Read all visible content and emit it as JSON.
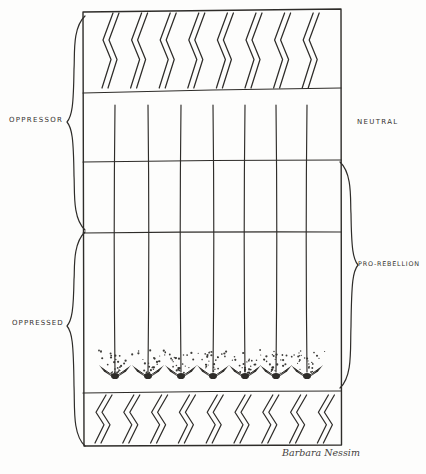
{
  "figure": {
    "labels": {
      "oppressor": "OPPRESSOR",
      "neutral": "NEUTRAL",
      "oppressed": "OPPRESSED",
      "pro_rebellion": "PRO-REBELLION"
    },
    "signature": "Barbara Nessim",
    "colors": {
      "ink": "#2e2c29",
      "paper": "#fdfdfc",
      "label_ink": "#35332f"
    }
  },
  "diagram": {
    "box": {
      "x": 83,
      "y": 10,
      "w": 258,
      "h": 435
    },
    "horizontals": [
      {
        "yl": 93,
        "yr": 88
      },
      {
        "yl": 162,
        "yr": 160
      },
      {
        "yl": 233,
        "yr": 232
      },
      {
        "yl": 393,
        "yr": 391
      }
    ],
    "top_band": {
      "y0": 13,
      "y1": 88,
      "count": 8,
      "x_start": 107,
      "spacing": 28.6
    },
    "bottom_band": {
      "y0": 395,
      "y1": 443,
      "count": 9,
      "x_start": 100,
      "spacing": 27.8
    },
    "vertical_lines_x": [
      115,
      148,
      181,
      213,
      245,
      276,
      307
    ],
    "vertical_top_y": 105,
    "arrow_tip_y": 376,
    "braces": [
      {
        "side": "left",
        "y0": 16,
        "y1": 230,
        "point_y": 122,
        "for_label": "oppressor"
      },
      {
        "side": "left",
        "y0": 232,
        "y1": 446,
        "point_y": 326,
        "for_label": "oppressed"
      },
      {
        "side": "right",
        "y0": 162,
        "y1": 388,
        "point_y": 265,
        "for_label": "pro_rebellion"
      }
    ]
  }
}
